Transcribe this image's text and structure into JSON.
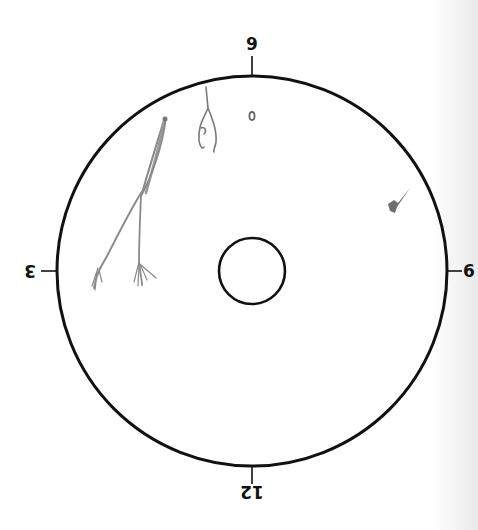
{
  "diagram": {
    "type": "clock-position field diagram (image rotated 180°)",
    "outer_circle": {
      "cx": 252,
      "cy": 271,
      "r": 195,
      "stroke": "#111111"
    },
    "inner_circle": {
      "cx": 252,
      "cy": 271,
      "r": 33,
      "stroke": "#111111"
    },
    "clock_labels": {
      "top": "9",
      "right": "6",
      "bottom": "12",
      "left": "3"
    },
    "markings": [
      {
        "name": "long-fiber-strands",
        "description": "Two long forked grey fiber strands in upper-left area",
        "color": "#8a8a8a"
      },
      {
        "name": "looped-fiber",
        "description": "Small looped fiber near top",
        "color": "#7a7a7a"
      },
      {
        "name": "small-spot",
        "description": "Small oval spot near top center",
        "color": "#666666"
      },
      {
        "name": "small-particle",
        "description": "Small dark particle near right edge",
        "color": "#555555"
      }
    ]
  }
}
